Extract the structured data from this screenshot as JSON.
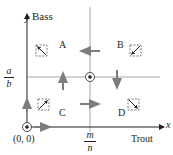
{
  "diagram": {
    "type": "phase-plane",
    "axes": {
      "y_var": "y",
      "y_label": "Bass",
      "x_var": "x",
      "x_label": "Trout",
      "origin_label": "(0, 0)"
    },
    "equilibrium": {
      "x_fraction": {
        "numerator": "m",
        "denominator": "n"
      },
      "y_fraction": {
        "numerator": "a",
        "denominator": "b"
      }
    },
    "regions": [
      {
        "id": "A",
        "label": "A"
      },
      {
        "id": "B",
        "label": "B"
      },
      {
        "id": "C",
        "label": "C"
      },
      {
        "id": "D",
        "label": "D"
      }
    ],
    "flow_arrows": [
      {
        "where": "upper nullcline segment",
        "direction": "left"
      },
      {
        "where": "left nullcline segment",
        "direction": "up"
      },
      {
        "where": "right nullcline segment",
        "direction": "down"
      },
      {
        "where": "lower nullcline segment",
        "direction": "right"
      },
      {
        "where": "y-axis",
        "direction": "up"
      },
      {
        "where": "x-axis",
        "direction": "right"
      }
    ],
    "colors": {
      "ink": "#231f20",
      "nullcline": "#9b9b9b",
      "arrow": "#808080",
      "equilibrium_point": "#231f20"
    }
  }
}
